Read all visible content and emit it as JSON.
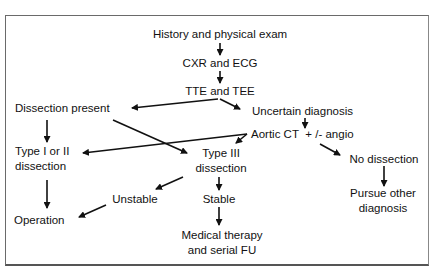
{
  "diagram": {
    "type": "flowchart",
    "nodes": {
      "history": {
        "lines": [
          "History and physical exam"
        ]
      },
      "cxr": {
        "lines": [
          "CXR and ECG"
        ]
      },
      "tte": {
        "lines": [
          "TTE and TEE"
        ]
      },
      "dissection_present": {
        "lines": [
          "Dissection present"
        ]
      },
      "uncertain": {
        "lines": [
          "Uncertain diagnosis"
        ]
      },
      "aortic_ct": {
        "lines": [
          "Aortic CT",
          "+ /- angio"
        ]
      },
      "type12": {
        "lines": [
          "Type I or II",
          "dissection"
        ]
      },
      "type3": {
        "lines": [
          "Type III",
          "dissection"
        ]
      },
      "no_dissection": {
        "lines": [
          "No dissection"
        ]
      },
      "unstable": {
        "lines": [
          "Unstable"
        ]
      },
      "stable": {
        "lines": [
          "Stable"
        ]
      },
      "operation": {
        "lines": [
          "Operation"
        ]
      },
      "medical": {
        "lines": [
          "Medical therapy",
          "and serial FU"
        ]
      },
      "pursue": {
        "lines": [
          "Pursue other",
          "diagnosis"
        ]
      }
    },
    "edges": [
      {
        "from": "History and physical exam",
        "to": "CXR and ECG"
      },
      {
        "from": "CXR and ECG",
        "to": "TTE and TEE"
      },
      {
        "from": "TTE and TEE",
        "to": "Dissection present"
      },
      {
        "from": "TTE and TEE",
        "to": "Uncertain diagnosis"
      },
      {
        "from": "Uncertain diagnosis",
        "to": "Aortic CT +/- angio"
      },
      {
        "from": "Dissection present",
        "to": "Type I or II dissection"
      },
      {
        "from": "Dissection present",
        "to": "Type III dissection"
      },
      {
        "from": "Aortic CT +/- angio",
        "to": "Type I or II dissection"
      },
      {
        "from": "Aortic CT +/- angio",
        "to": "Type III dissection"
      },
      {
        "from": "Aortic CT +/- angio",
        "to": "No dissection"
      },
      {
        "from": "No dissection",
        "to": "Pursue other diagnosis"
      },
      {
        "from": "Type III dissection",
        "to": "Unstable"
      },
      {
        "from": "Type III dissection",
        "to": "Stable"
      },
      {
        "from": "Type I or II dissection",
        "to": "Operation"
      },
      {
        "from": "Unstable",
        "to": "Operation"
      },
      {
        "from": "Stable",
        "to": "Medical therapy and serial FU"
      }
    ],
    "colors": {
      "ink": "#111111",
      "frame": "#6a6a6a",
      "background": "#ffffff"
    }
  }
}
